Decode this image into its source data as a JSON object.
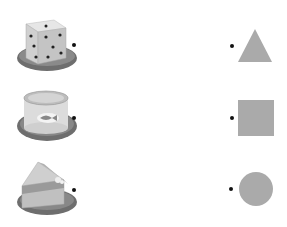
{
  "worksheet": {
    "task": "Match each object to its shape",
    "left_items": [
      {
        "name": "dice",
        "shape_3d": "cube"
      },
      {
        "name": "tin-can",
        "shape_3d": "cylinder"
      },
      {
        "name": "cake-slice",
        "shape_3d": "triangular-prism"
      }
    ],
    "right_items": [
      {
        "name": "triangle"
      },
      {
        "name": "square"
      },
      {
        "name": "circle"
      }
    ],
    "colors": {
      "shape_fill": "#aaaaaa",
      "plate": "#6e6e6e",
      "dot": "#111111"
    }
  }
}
